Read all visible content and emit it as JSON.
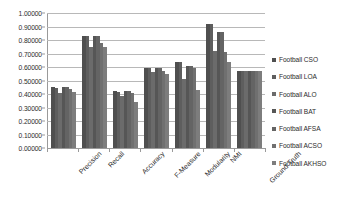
{
  "chart_data": {
    "type": "bar",
    "title": "",
    "xlabel": "",
    "ylabel": "",
    "ylim": [
      0,
      1
    ],
    "grid": true,
    "legend_position": "right",
    "categories": [
      "Precision",
      "Recall",
      "Accuracy",
      "F-Measure",
      "Modularity",
      "NMI",
      "Ground Truth"
    ],
    "ytick_labels": [
      "1.00000",
      "0.90000",
      "0.80000",
      "0.70000",
      "0.60000",
      "0.50000",
      "0.40000",
      "0.30000",
      "0.20000",
      "0.10000",
      "0.00000"
    ],
    "ytick_values": [
      1.0,
      0.9,
      0.8,
      0.7,
      0.6,
      0.5,
      0.4,
      0.3,
      0.2,
      0.1,
      0.0
    ],
    "series": [
      {
        "name": "Football CSO",
        "color": "#4f4f4f",
        "values": [
          0.45,
          0.83,
          0.42,
          0.59,
          0.64,
          0.92,
          0.57
        ]
      },
      {
        "name": "Football LOA",
        "color": "#5e5e5e",
        "values": [
          0.445,
          0.83,
          0.415,
          0.59,
          0.635,
          0.92,
          0.57
        ]
      },
      {
        "name": "Football ALO",
        "color": "#6b6b6b",
        "values": [
          0.41,
          0.75,
          0.385,
          0.56,
          0.51,
          0.72,
          0.57
        ]
      },
      {
        "name": "Football BAT",
        "color": "#565656",
        "values": [
          0.45,
          0.83,
          0.42,
          0.59,
          0.61,
          0.86,
          0.57
        ]
      },
      {
        "name": "Football AFSA",
        "color": "#646464",
        "values": [
          0.45,
          0.83,
          0.42,
          0.59,
          0.61,
          0.86,
          0.57
        ]
      },
      {
        "name": "Football ACSO",
        "color": "#707070",
        "values": [
          0.44,
          0.78,
          0.41,
          0.57,
          0.59,
          0.71,
          0.57
        ]
      },
      {
        "name": "Football AKHSO",
        "color": "#7d7d7d",
        "values": [
          0.415,
          0.75,
          0.34,
          0.55,
          0.43,
          0.64,
          0.57
        ]
      }
    ]
  }
}
